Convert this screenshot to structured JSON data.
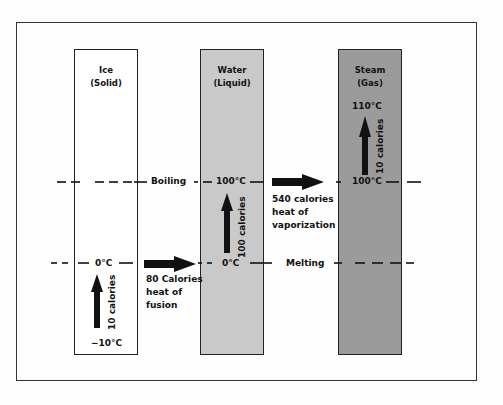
{
  "diagram": {
    "columns": [
      {
        "name": "Ice",
        "state": "(Solid)",
        "fill": "#ffffff"
      },
      {
        "name": "Water",
        "state": "(Liquid)",
        "fill": "#c9c9c9"
      },
      {
        "name": "Steam",
        "state": "(Gas)",
        "fill": "#9b9b9b"
      }
    ],
    "lines": {
      "boiling": "Boiling",
      "melting": "Melting"
    },
    "temperatures": {
      "ice_bottom": "−10°C",
      "ice_top": "0°C",
      "water_bottom": "0°C",
      "water_top": "100°C",
      "steam_bottom": "100°C",
      "steam_top": "110°C"
    },
    "arrows": {
      "ice_heating": "10 calories",
      "water_heating": "100 calories",
      "steam_heating": "10 calories",
      "fusion": [
        "80 Calories",
        "heat of",
        "fusion"
      ],
      "vaporization": [
        "540 calories",
        "heat of",
        "vaporization"
      ]
    }
  }
}
